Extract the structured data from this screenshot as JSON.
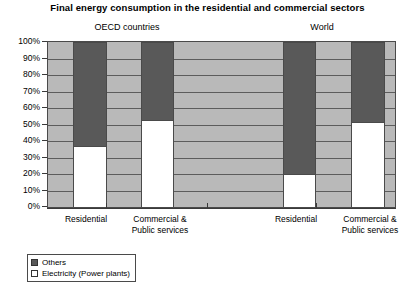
{
  "chart_data": {
    "type": "bar",
    "title": "Final energy consumption in the residential and commercial sectors",
    "xlabel": "",
    "ylabel": "",
    "ylim": [
      0,
      100
    ],
    "stacked": true,
    "normalized_percent": true,
    "grid": true,
    "legend_position": "bottom-left",
    "groups": [
      {
        "name": "OECD countries"
      },
      {
        "name": "World"
      }
    ],
    "categories": [
      "Residential",
      "Commercial &\nPublic services",
      "Residential",
      "Commercial &\nPublic services"
    ],
    "category_groups": [
      "OECD countries",
      "OECD countries",
      "World",
      "World"
    ],
    "series": [
      {
        "name": "Others",
        "color": "#595959",
        "values": [
          63,
          47,
          80,
          48
        ]
      },
      {
        "name": "Electricity (Power plants)",
        "color": "#ffffff",
        "values": [
          37,
          53,
          20,
          52
        ]
      }
    ],
    "y_ticks": [
      "0%",
      "10%",
      "20%",
      "30%",
      "40%",
      "50%",
      "60%",
      "70%",
      "80%",
      "90%",
      "100%"
    ],
    "y_tick_values": [
      0,
      10,
      20,
      30,
      40,
      50,
      60,
      70,
      80,
      90,
      100
    ]
  },
  "legend": {
    "items": [
      {
        "label": "Others",
        "color": "#595959"
      },
      {
        "label": "Electricity (Power plants)",
        "color": "#ffffff"
      }
    ]
  },
  "colors": {
    "others": "#595959",
    "electricity": "#ffffff",
    "plot_background": "#b9b9b9",
    "gridline": "#5c5c5c",
    "axis": "#3a3a3a"
  }
}
